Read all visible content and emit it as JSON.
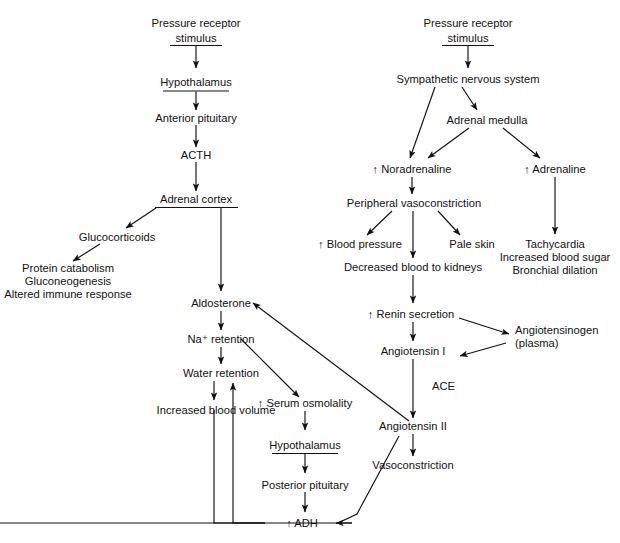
{
  "diagram": {
    "background_color": "#ffffff",
    "line_color": "#111111",
    "text_color": "#111111",
    "nodes": {
      "pressure_receptor_left_l1": "Pressure receptor",
      "pressure_receptor_left_l2": "stimulus",
      "hypothalamus_left": "Hypothalamus",
      "anterior_pituitary": "Anterior pituitary",
      "acth": "ACTH",
      "adrenal_cortex": "Adrenal cortex",
      "glucocorticoids": "Glucocorticoids",
      "protein_catabolism": "Protein catabolism",
      "gluconeogenesis": "Gluconeogenesis",
      "altered_immune_response": "Altered immune response",
      "aldosterone": "Aldosterone",
      "na_retention": "Na⁺ retention",
      "water_retention": "Water retention",
      "increased_blood_volume": "Increased blood volume",
      "serum_osmolality": "↑ Serum osmolality",
      "hypothalamus_lower": "Hypothalamus",
      "posterior_pituitary": "Posterior pituitary",
      "adh": "↑ ADH",
      "pressure_receptor_right_l1": "Pressure receptor",
      "pressure_receptor_right_l2": "stimulus",
      "sympathetic_nervous_system": "Sympathetic nervous system",
      "adrenal_medulla": "Adrenal medulla",
      "noradrenaline": "↑ Noradrenaline",
      "adrenaline": "↑ Adrenaline",
      "peripheral_vasoconstriction": "Peripheral vasoconstriction",
      "blood_pressure": "↑ Blood pressure",
      "pale_skin": "Pale skin",
      "decreased_blood_to_kidneys": "Decreased blood to kidneys",
      "tachycardia": "Tachycardia",
      "increased_blood_sugar": "Increased blood sugar",
      "bronchial_dilation": "Bronchial dilation",
      "renin_secretion": "↑ Renin secretion",
      "angiotensinogen_l1": "Angiotensinogen",
      "angiotensinogen_l2": "(plasma)",
      "angiotensin_i": "Angiotensin I",
      "ace": "ACE",
      "angiotensin_ii": "Angiotensin II",
      "vasoconstriction": "Vasoconstriction"
    }
  }
}
